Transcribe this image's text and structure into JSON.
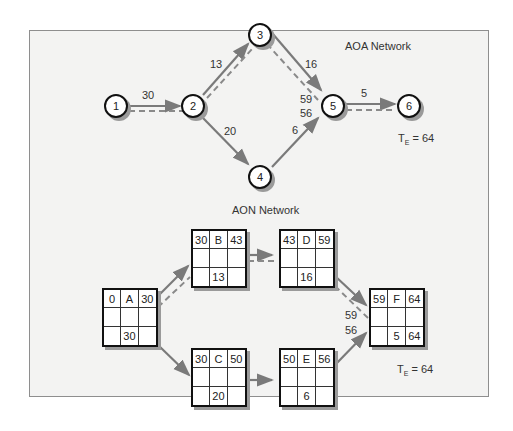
{
  "aoa": {
    "title": "AOA Network",
    "nodes": [
      {
        "id": "1"
      },
      {
        "id": "2"
      },
      {
        "id": "3"
      },
      {
        "id": "4"
      },
      {
        "id": "5"
      },
      {
        "id": "6"
      }
    ],
    "edges": [
      {
        "from": "1",
        "to": "2",
        "duration": "30",
        "critical": true
      },
      {
        "from": "2",
        "to": "3",
        "duration": "13",
        "critical": true
      },
      {
        "from": "2",
        "to": "4",
        "duration": "20",
        "critical": false
      },
      {
        "from": "3",
        "to": "5",
        "duration": "16",
        "critical": true
      },
      {
        "from": "4",
        "to": "5",
        "duration": "6",
        "critical": false
      },
      {
        "from": "5",
        "to": "6",
        "duration": "5",
        "critical": true
      }
    ],
    "merge_labels": {
      "top": "59",
      "bottom": "56"
    },
    "te_label": "T",
    "te_sub": "E",
    "te_value": "= 64"
  },
  "aon": {
    "title": "AON Network",
    "activities": [
      {
        "name": "A",
        "es": "0",
        "ef": "30",
        "dur": "30",
        "lf": ""
      },
      {
        "name": "B",
        "es": "30",
        "ef": "43",
        "dur": "13",
        "lf": ""
      },
      {
        "name": "C",
        "es": "30",
        "ef": "50",
        "dur": "20",
        "lf": ""
      },
      {
        "name": "D",
        "es": "43",
        "ef": "59",
        "dur": "16",
        "lf": ""
      },
      {
        "name": "E",
        "es": "50",
        "ef": "56",
        "dur": "6",
        "lf": ""
      },
      {
        "name": "F",
        "es": "59",
        "ef": "64",
        "dur": "5",
        "lf": "64"
      }
    ],
    "merge_labels": {
      "top": "59",
      "bottom": "56"
    },
    "te_label": "T",
    "te_sub": "E",
    "te_value": "= 64"
  },
  "colors": {
    "arrow": "#7a7a7a",
    "critical_dash": "#8a8a8a",
    "panel_bg": "#f3f3f2",
    "panel_border": "#8e8e8e"
  }
}
